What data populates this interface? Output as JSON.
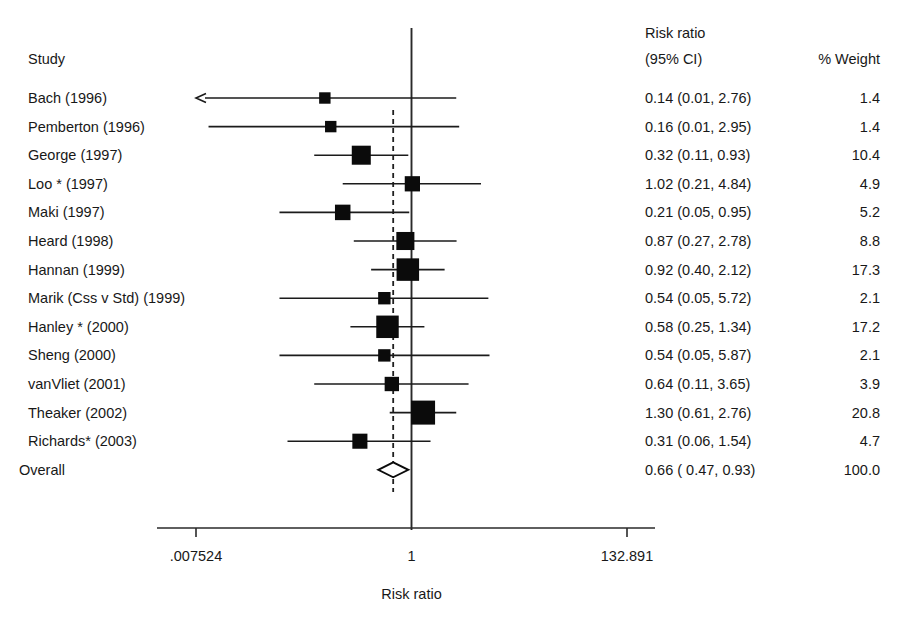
{
  "figure": {
    "columns": {
      "study_header": "Study",
      "effect_header_line1": "Risk ratio",
      "effect_header_line2": "(95% CI)",
      "weight_header": "% Weight"
    },
    "axis": {
      "title": "Risk ratio",
      "scale": "log",
      "tick_labels": [
        ".007524",
        "1",
        "132.891"
      ],
      "tick_values": [
        0.007524,
        1,
        132.891
      ],
      "null_value": 1
    },
    "overall_label": "Overall",
    "colors": {
      "marker": "#0b0b0b",
      "line": "#1b1b1b",
      "text": "#181818",
      "background": "#ffffff"
    }
  },
  "chart_data": {
    "type": "forest",
    "title": "",
    "xlabel": "Risk ratio",
    "ylabel": "",
    "xscale": "log",
    "xlim": [
      0.007524,
      132.891
    ],
    "xticks": [
      0.007524,
      1,
      132.891
    ],
    "xticklabels": [
      ".007524",
      "1",
      "132.891"
    ],
    "grid": false,
    "legend": "none",
    "null_line": 1,
    "pooled_line": 0.66,
    "categories": [
      "Bach (1996)",
      "Pemberton (1996)",
      "George (1997)",
      "Loo * (1997)",
      "Maki (1997)",
      "Heard (1998)",
      "Hannan (1999)",
      "Marik (Css v Std) (1999)",
      "Hanley * (2000)",
      "Sheng (2000)",
      "vanVliet (2001)",
      "Theaker (2002)",
      "Richards* (2003)"
    ],
    "rows": [
      {
        "study": "Bach (1996)",
        "rr": 0.14,
        "lcl": 0.01,
        "ucl": 2.76,
        "weight": 1.4,
        "effect_text": "0.14 (0.01, 2.76)",
        "weight_text": "1.4",
        "arrow_left": true
      },
      {
        "study": "Pemberton (1996)",
        "rr": 0.16,
        "lcl": 0.01,
        "ucl": 2.95,
        "weight": 1.4,
        "effect_text": "0.16 (0.01, 2.95)",
        "weight_text": "1.4",
        "arrow_left": false
      },
      {
        "study": "George (1997)",
        "rr": 0.32,
        "lcl": 0.11,
        "ucl": 0.93,
        "weight": 10.4,
        "effect_text": "0.32 (0.11, 0.93)",
        "weight_text": "10.4",
        "arrow_left": false
      },
      {
        "study": "Loo * (1997)",
        "rr": 1.02,
        "lcl": 0.21,
        "ucl": 4.84,
        "weight": 4.9,
        "effect_text": "1.02 (0.21, 4.84)",
        "weight_text": "4.9",
        "arrow_left": false
      },
      {
        "study": "Maki (1997)",
        "rr": 0.21,
        "lcl": 0.05,
        "ucl": 0.95,
        "weight": 5.2,
        "effect_text": "0.21 (0.05, 0.95)",
        "weight_text": "5.2",
        "arrow_left": false
      },
      {
        "study": "Heard (1998)",
        "rr": 0.87,
        "lcl": 0.27,
        "ucl": 2.78,
        "weight": 8.8,
        "effect_text": "0.87 (0.27, 2.78)",
        "weight_text": "8.8",
        "arrow_left": false
      },
      {
        "study": "Hannan (1999)",
        "rr": 0.92,
        "lcl": 0.4,
        "ucl": 2.12,
        "weight": 17.3,
        "effect_text": "0.92 (0.40, 2.12)",
        "weight_text": "17.3",
        "arrow_left": false
      },
      {
        "study": "Marik (Css v Std) (1999)",
        "rr": 0.54,
        "lcl": 0.05,
        "ucl": 5.72,
        "weight": 2.1,
        "effect_text": "0.54 (0.05, 5.72)",
        "weight_text": "2.1",
        "arrow_left": false
      },
      {
        "study": "Hanley * (2000)",
        "rr": 0.58,
        "lcl": 0.25,
        "ucl": 1.34,
        "weight": 17.2,
        "effect_text": "0.58 (0.25, 1.34)",
        "weight_text": "17.2",
        "arrow_left": false
      },
      {
        "study": "Sheng (2000)",
        "rr": 0.54,
        "lcl": 0.05,
        "ucl": 5.87,
        "weight": 2.1,
        "effect_text": "0.54 (0.05, 5.87)",
        "weight_text": "2.1",
        "arrow_left": false
      },
      {
        "study": "vanVliet (2001)",
        "rr": 0.64,
        "lcl": 0.11,
        "ucl": 3.65,
        "weight": 3.9,
        "effect_text": "0.64 (0.11, 3.65)",
        "weight_text": "3.9",
        "arrow_left": false
      },
      {
        "study": "Theaker (2002)",
        "rr": 1.3,
        "lcl": 0.61,
        "ucl": 2.76,
        "weight": 20.8,
        "effect_text": "1.30 (0.61, 2.76)",
        "weight_text": "20.8",
        "arrow_left": false
      },
      {
        "study": "Richards* (2003)",
        "rr": 0.31,
        "lcl": 0.06,
        "ucl": 1.54,
        "weight": 4.7,
        "effect_text": "0.31 (0.06, 1.54)",
        "weight_text": "4.7",
        "arrow_left": false
      }
    ],
    "overall": {
      "study": "Overall",
      "rr": 0.66,
      "lcl": 0.47,
      "ucl": 0.93,
      "weight": 100.0,
      "effect_text": "0.66 ( 0.47, 0.93)",
      "weight_text": "100.0"
    }
  }
}
